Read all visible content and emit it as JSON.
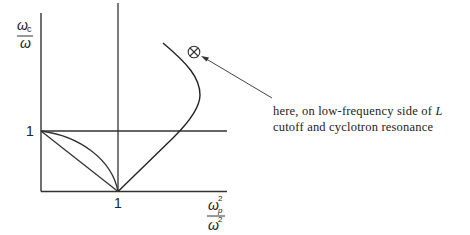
{
  "diagram": {
    "y_axis_label": {
      "numerator": "ω",
      "numerator_sub": "c",
      "denominator": "ω"
    },
    "x_axis_label": {
      "numerator": "ω",
      "numerator_sub": "p",
      "numerator_sup": "2",
      "denominator": "ω",
      "denominator_sup": "2"
    },
    "y_tick_label": "1",
    "x_tick_label": "1",
    "marker_symbol": "⊗",
    "annotation": {
      "line1": "here, on low-frequency side of ",
      "line1_italic": "L",
      "line2": "cutoff and cyclotron resonance"
    },
    "colors": {
      "ink": "#222222",
      "background": "#ffffff"
    }
  }
}
